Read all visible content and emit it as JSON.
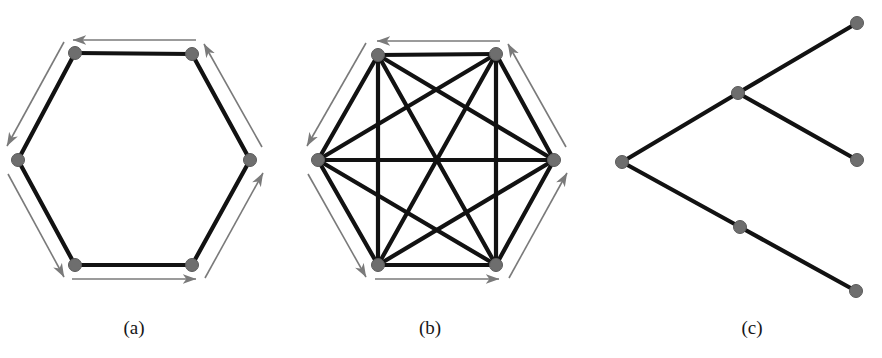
{
  "figure": {
    "background_color": "#ffffff",
    "edge_color": "#121212",
    "vertex_color": "#6e6e6e",
    "vertex_stroke_color": "#5a5a5a",
    "arrow_color": "#7a7a7a",
    "caption_color": "#161616",
    "vertex_radius": 6.5,
    "edge_width": 4.2,
    "arrow_width": 1.6
  },
  "panels": [
    {
      "id": "a",
      "caption": "(a)",
      "caption_x": 134,
      "caption_y": 328,
      "graph_type": "cycle",
      "description": "hexagonal cycle graph C6 with directed orientation arrows outside each edge",
      "vertices": [
        {
          "name": "v1",
          "x": 75,
          "y": 53
        },
        {
          "name": "v2",
          "x": 192,
          "y": 54
        },
        {
          "name": "v3",
          "x": 250,
          "y": 160
        },
        {
          "name": "v4",
          "x": 192,
          "y": 265
        },
        {
          "name": "v5",
          "x": 75,
          "y": 265
        },
        {
          "name": "v6",
          "x": 18,
          "y": 160
        }
      ],
      "edges": [
        {
          "from": 0,
          "to": 1
        },
        {
          "from": 1,
          "to": 2
        },
        {
          "from": 2,
          "to": 3
        },
        {
          "from": 3,
          "to": 4
        },
        {
          "from": 4,
          "to": 5
        },
        {
          "from": 5,
          "to": 0
        }
      ],
      "arrows": [
        {
          "name": "arrow-top",
          "x1": 196,
          "y1": 40,
          "x2": 73,
          "y2": 40
        },
        {
          "name": "arrow-upper-right",
          "x1": 262,
          "y1": 147,
          "x2": 204,
          "y2": 44
        },
        {
          "name": "arrow-lower-right",
          "x1": 205,
          "y1": 278,
          "x2": 263,
          "y2": 173
        },
        {
          "name": "arrow-bottom",
          "x1": 72,
          "y1": 279,
          "x2": 196,
          "y2": 279
        },
        {
          "name": "arrow-lower-left",
          "x1": 8,
          "y1": 174,
          "x2": 64,
          "y2": 277
        },
        {
          "name": "arrow-upper-left",
          "x1": 64,
          "y1": 42,
          "x2": 7,
          "y2": 146
        }
      ]
    },
    {
      "id": "b",
      "caption": "(b)",
      "caption_x": 430,
      "caption_y": 328,
      "graph_type": "complete",
      "description": "complete graph K6 on six hexagon vertices with the same outer orientation arrows",
      "vertices": [
        {
          "name": "v1",
          "x": 378,
          "y": 55
        },
        {
          "name": "v2",
          "x": 496,
          "y": 54
        },
        {
          "name": "v3",
          "x": 554,
          "y": 160
        },
        {
          "name": "v4",
          "x": 496,
          "y": 265
        },
        {
          "name": "v5",
          "x": 378,
          "y": 265
        },
        {
          "name": "v6",
          "x": 318,
          "y": 160
        }
      ],
      "edges": [
        {
          "from": 0,
          "to": 1
        },
        {
          "from": 0,
          "to": 2
        },
        {
          "from": 0,
          "to": 3
        },
        {
          "from": 0,
          "to": 4
        },
        {
          "from": 0,
          "to": 5
        },
        {
          "from": 1,
          "to": 2
        },
        {
          "from": 1,
          "to": 3
        },
        {
          "from": 1,
          "to": 4
        },
        {
          "from": 1,
          "to": 5
        },
        {
          "from": 2,
          "to": 3
        },
        {
          "from": 2,
          "to": 4
        },
        {
          "from": 2,
          "to": 5
        },
        {
          "from": 3,
          "to": 4
        },
        {
          "from": 3,
          "to": 5
        },
        {
          "from": 4,
          "to": 5
        }
      ],
      "arrows": [
        {
          "name": "arrow-top",
          "x1": 500,
          "y1": 41,
          "x2": 377,
          "y2": 41
        },
        {
          "name": "arrow-upper-right",
          "x1": 566,
          "y1": 147,
          "x2": 508,
          "y2": 44
        },
        {
          "name": "arrow-lower-right",
          "x1": 509,
          "y1": 278,
          "x2": 567,
          "y2": 173
        },
        {
          "name": "arrow-bottom",
          "x1": 375,
          "y1": 279,
          "x2": 499,
          "y2": 279
        },
        {
          "name": "arrow-lower-left",
          "x1": 308,
          "y1": 174,
          "x2": 366,
          "y2": 277
        },
        {
          "name": "arrow-upper-left",
          "x1": 366,
          "y1": 43,
          "x2": 307,
          "y2": 146
        }
      ]
    },
    {
      "id": "c",
      "caption": "(c)",
      "caption_x": 752,
      "caption_y": 328,
      "graph_type": "tree",
      "description": "tree with six vertices: a root splitting into an upper branch node with two leaves and a lower path through an internal node to a leaf",
      "vertices": [
        {
          "name": "root",
          "x": 622,
          "y": 162
        },
        {
          "name": "branch-up",
          "x": 738,
          "y": 93
        },
        {
          "name": "leaf-top",
          "x": 857,
          "y": 23
        },
        {
          "name": "leaf-middle",
          "x": 857,
          "y": 160
        },
        {
          "name": "node-lower",
          "x": 740,
          "y": 227
        },
        {
          "name": "leaf-bottom",
          "x": 856,
          "y": 291
        }
      ],
      "edges": [
        {
          "from": 0,
          "to": 1
        },
        {
          "from": 1,
          "to": 2
        },
        {
          "from": 1,
          "to": 3
        },
        {
          "from": 0,
          "to": 4
        },
        {
          "from": 4,
          "to": 5
        }
      ],
      "arrows": []
    }
  ]
}
